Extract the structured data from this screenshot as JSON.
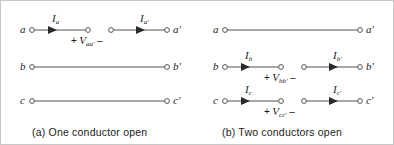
{
  "figure": {
    "panels": [
      {
        "id": "panel-a",
        "caption": "(a)  One conductor open",
        "rows": [
          {
            "left_terminal": "a",
            "right_terminal": "a'",
            "broken": true,
            "currents": [
              {
                "symbol": "I",
                "subscript": "a"
              },
              {
                "symbol": "I",
                "subscript": "a'"
              }
            ],
            "voltage": {
              "plus": "+",
              "symbol": "V",
              "subscript": "aa'",
              "minus": "–"
            }
          },
          {
            "left_terminal": "b",
            "right_terminal": "b'",
            "broken": false,
            "currents": [],
            "voltage": null
          },
          {
            "left_terminal": "c",
            "right_terminal": "c'",
            "broken": false,
            "currents": [],
            "voltage": null
          }
        ]
      },
      {
        "id": "panel-b",
        "caption": "(b)  Two conductors open",
        "rows": [
          {
            "left_terminal": "b",
            "right_terminal": "a'",
            "broken": false,
            "currents": [],
            "voltage": null
          },
          {
            "left_terminal": "b",
            "right_terminal": "b'",
            "broken": true,
            "currents": [
              {
                "symbol": "I",
                "subscript": "b"
              },
              {
                "symbol": "I",
                "subscript": "b'"
              }
            ],
            "voltage": {
              "plus": "+",
              "symbol": "V",
              "subscript": "bb'",
              "minus": "–"
            }
          },
          {
            "left_terminal": "c",
            "right_terminal": "c'",
            "broken": true,
            "currents": [
              {
                "symbol": "I",
                "subscript": "c"
              },
              {
                "symbol": "I",
                "subscript": "c'"
              }
            ],
            "voltage": {
              "plus": "+",
              "symbol": "V",
              "subscript": "cc'",
              "minus": "–"
            }
          }
        ]
      }
    ],
    "panel_b_row_a_left_terminal": "a",
    "colors": {
      "line": "#555555",
      "text": "#1a1a1a",
      "node_stroke": "#555555",
      "node_fill": "#ffffff",
      "border": "#c8c8c8",
      "background": "#ffffff"
    },
    "icons": {
      "node": "open-circle-terminal",
      "arrow": "current-direction-arrowhead"
    }
  }
}
